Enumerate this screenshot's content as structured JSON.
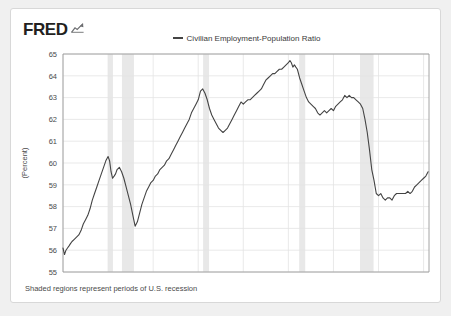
{
  "branding": {
    "wordmark": "FRED",
    "mark_icon": "fred-chart-mark-icon"
  },
  "legend": {
    "position": "top-center",
    "entries": [
      {
        "label": "Civilian Employment-Population Ratio",
        "color": "#444444"
      }
    ]
  },
  "footnote": "Shaded regions represent periods of U.S. recession",
  "colors": {
    "line": "#444444",
    "grid": "#e3e3e3",
    "axis": "#9a9a9a",
    "recession_band": "#e8e8e8",
    "card_background": "#ffffff",
    "page_background": "#f0f0f0",
    "text": "#4a4a4a"
  },
  "chart_data": {
    "type": "line",
    "title": "",
    "subtitle": "",
    "xlabel": "",
    "ylabel": "(Percent)",
    "grid": true,
    "legend_position": "top-center",
    "xlim": [
      1975.0,
      2015.6
    ],
    "ylim": [
      55,
      65
    ],
    "xticks": [
      1975,
      1980,
      1985,
      1990,
      1995,
      2000,
      2005,
      2010,
      2015
    ],
    "xticklabels": [
      "1975",
      "1980",
      "1985",
      "1990",
      "1995",
      "2000",
      "2005",
      "2010",
      "2015"
    ],
    "yticks": [
      55,
      56,
      57,
      58,
      59,
      60,
      61,
      62,
      63,
      64,
      65
    ],
    "yticklabels": [
      "55",
      "56",
      "57",
      "58",
      "59",
      "60",
      "61",
      "62",
      "63",
      "64",
      "65"
    ],
    "annotations": [
      {
        "text": "Shaded regions represent periods of U.S. recession",
        "position": "below-axis-left"
      }
    ],
    "shaded_regions": [
      {
        "label": "1980 recession",
        "x0": 1980.0,
        "x1": 1980.54
      },
      {
        "label": "1981-82 recession",
        "x0": 1981.54,
        "x1": 1982.87
      },
      {
        "label": "1990-91 recession",
        "x0": 1990.54,
        "x1": 1991.2
      },
      {
        "label": "2001 recession",
        "x0": 2001.2,
        "x1": 2001.87
      },
      {
        "label": "2007-09 recession",
        "x0": 2007.95,
        "x1": 2009.45
      }
    ],
    "series": [
      {
        "name": "Civilian Employment-Population Ratio",
        "color": "#444444",
        "x": [
          1975.0,
          1975.17,
          1975.33,
          1975.5,
          1975.67,
          1975.83,
          1976.0,
          1976.25,
          1976.5,
          1976.75,
          1977.0,
          1977.25,
          1977.5,
          1977.75,
          1978.0,
          1978.25,
          1978.5,
          1978.75,
          1979.0,
          1979.25,
          1979.5,
          1979.75,
          1980.0,
          1980.17,
          1980.33,
          1980.5,
          1980.67,
          1980.83,
          1981.0,
          1981.25,
          1981.5,
          1981.75,
          1982.0,
          1982.25,
          1982.5,
          1982.75,
          1983.0,
          1983.25,
          1983.5,
          1983.75,
          1984.0,
          1984.25,
          1984.5,
          1984.75,
          1985.0,
          1985.25,
          1985.5,
          1985.75,
          1986.0,
          1986.25,
          1986.5,
          1986.75,
          1987.0,
          1987.25,
          1987.5,
          1987.75,
          1988.0,
          1988.25,
          1988.5,
          1988.75,
          1989.0,
          1989.25,
          1989.5,
          1989.75,
          1990.0,
          1990.25,
          1990.5,
          1990.75,
          1991.0,
          1991.25,
          1991.5,
          1991.75,
          1992.0,
          1992.25,
          1992.5,
          1992.75,
          1993.0,
          1993.25,
          1993.5,
          1993.75,
          1994.0,
          1994.25,
          1994.5,
          1994.75,
          1995.0,
          1995.25,
          1995.5,
          1995.75,
          1996.0,
          1996.25,
          1996.5,
          1996.75,
          1997.0,
          1997.25,
          1997.5,
          1997.75,
          1998.0,
          1998.25,
          1998.5,
          1998.75,
          1999.0,
          1999.25,
          1999.5,
          1999.75,
          2000.0,
          2000.17,
          2000.33,
          2000.5,
          2000.67,
          2000.83,
          2001.0,
          2001.25,
          2001.5,
          2001.75,
          2002.0,
          2002.25,
          2002.5,
          2002.75,
          2003.0,
          2003.25,
          2003.5,
          2003.75,
          2004.0,
          2004.25,
          2004.5,
          2004.75,
          2005.0,
          2005.25,
          2005.5,
          2005.75,
          2006.0,
          2006.25,
          2006.5,
          2006.75,
          2007.0,
          2007.25,
          2007.5,
          2007.75,
          2008.0,
          2008.25,
          2008.5,
          2008.75,
          2009.0,
          2009.25,
          2009.5,
          2009.75,
          2010.0,
          2010.25,
          2010.5,
          2010.75,
          2011.0,
          2011.25,
          2011.5,
          2011.75,
          2012.0,
          2012.25,
          2012.5,
          2012.75,
          2013.0,
          2013.25,
          2013.5,
          2013.75,
          2014.0,
          2014.25,
          2014.5,
          2014.75,
          2015.0,
          2015.25,
          2015.5
        ],
        "y": [
          56.1,
          55.8,
          56.0,
          56.1,
          56.2,
          56.3,
          56.4,
          56.5,
          56.6,
          56.7,
          56.9,
          57.2,
          57.4,
          57.6,
          57.9,
          58.3,
          58.6,
          58.9,
          59.2,
          59.5,
          59.8,
          60.1,
          60.3,
          60.1,
          59.6,
          59.3,
          59.4,
          59.5,
          59.7,
          59.8,
          59.6,
          59.3,
          58.9,
          58.5,
          58.1,
          57.6,
          57.1,
          57.3,
          57.7,
          58.1,
          58.4,
          58.7,
          58.9,
          59.1,
          59.2,
          59.4,
          59.5,
          59.7,
          59.8,
          59.9,
          60.1,
          60.2,
          60.4,
          60.6,
          60.8,
          61.0,
          61.2,
          61.4,
          61.6,
          61.8,
          62.0,
          62.3,
          62.5,
          62.7,
          62.9,
          63.3,
          63.4,
          63.2,
          62.9,
          62.5,
          62.2,
          62.0,
          61.8,
          61.6,
          61.5,
          61.4,
          61.5,
          61.6,
          61.8,
          62.0,
          62.2,
          62.4,
          62.6,
          62.8,
          62.7,
          62.8,
          62.9,
          62.9,
          63.0,
          63.1,
          63.2,
          63.3,
          63.4,
          63.6,
          63.8,
          63.9,
          64.0,
          64.1,
          64.1,
          64.2,
          64.3,
          64.3,
          64.4,
          64.5,
          64.6,
          64.7,
          64.6,
          64.4,
          64.5,
          64.4,
          64.3,
          63.9,
          63.6,
          63.3,
          63.0,
          62.8,
          62.7,
          62.6,
          62.5,
          62.3,
          62.2,
          62.3,
          62.4,
          62.3,
          62.4,
          62.5,
          62.4,
          62.6,
          62.7,
          62.8,
          62.9,
          63.1,
          63.0,
          63.1,
          63.0,
          63.0,
          62.9,
          62.8,
          62.7,
          62.5,
          62.0,
          61.4,
          60.6,
          59.7,
          59.2,
          58.6,
          58.5,
          58.6,
          58.4,
          58.3,
          58.4,
          58.4,
          58.3,
          58.5,
          58.6,
          58.6,
          58.6,
          58.6,
          58.6,
          58.7,
          58.6,
          58.7,
          58.9,
          59.0,
          59.1,
          59.2,
          59.3,
          59.4,
          59.6
        ]
      }
    ]
  }
}
